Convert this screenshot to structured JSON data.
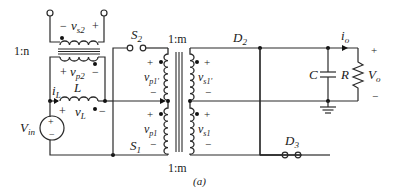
{
  "figure": {
    "caption": "(a)",
    "type": "circuit-schematic"
  },
  "components": {
    "vin": {
      "label": "V",
      "sub": "in"
    },
    "inductor": {
      "label": "L",
      "current_label": "i",
      "current_sub": "L",
      "voltage_label": "v",
      "voltage_sub": "L",
      "plus": "+",
      "minus": "−"
    },
    "aux_transformer": {
      "ratio": "1:n",
      "secondary_label": "v",
      "secondary_sub": "s2",
      "primary_label": "v",
      "primary_sub": "p2",
      "plus": "+",
      "minus": "−"
    },
    "main_transformer": {
      "ratio_top": "1:m",
      "ratio_bottom": "1:m",
      "windings": [
        {
          "label": "v",
          "sub": "p1'",
          "plus": "+",
          "minus": "−"
        },
        {
          "label": "v",
          "sub": "p1",
          "plus": "+",
          "minus": "−"
        },
        {
          "label": "v",
          "sub": "s1'",
          "plus": "+",
          "minus": "−"
        },
        {
          "label": "v",
          "sub": "s1",
          "plus": "+",
          "minus": "−"
        }
      ]
    },
    "switches": [
      {
        "label": "S",
        "sub": "2"
      },
      {
        "label": "S",
        "sub": "1"
      }
    ],
    "diodes": [
      {
        "label": "D",
        "sub": "2"
      },
      {
        "label": "D",
        "sub": "3"
      }
    ],
    "capacitor": {
      "label": "C"
    },
    "resistor": {
      "label": "R"
    },
    "output": {
      "current_label": "i",
      "current_sub": "o",
      "voltage_label": "V",
      "voltage_sub": "o",
      "plus": "+",
      "minus": "−"
    }
  }
}
